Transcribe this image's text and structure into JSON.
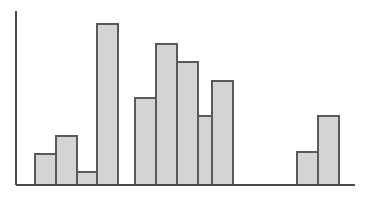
{
  "chart_data": {
    "type": "bar",
    "title": "",
    "subtitle": "",
    "xlabel": "",
    "ylabel": "",
    "categories": [
      "1",
      "2",
      "3",
      "4",
      "5",
      "6",
      "7",
      "8",
      "9",
      "10",
      "11"
    ],
    "values": [
      31,
      49,
      13,
      161,
      87,
      141,
      123,
      69,
      104,
      33,
      69
    ],
    "series": [
      {
        "name": "",
        "values": [
          31,
          49,
          13,
          161,
          87,
          141,
          123,
          69,
          104,
          33,
          69
        ]
      }
    ],
    "groups": [
      {
        "name": "group-left",
        "indices": [
          0,
          1,
          2,
          3
        ]
      },
      {
        "name": "group-middle",
        "indices": [
          4,
          5,
          6,
          7,
          8
        ]
      },
      {
        "name": "group-right",
        "indices": [
          9,
          10
        ]
      }
    ],
    "ylim": [
      0,
      174
    ],
    "xlim": [
      0,
      339
    ],
    "grid": false,
    "legend": null,
    "legend_position": "none",
    "tick_labels_x": [],
    "tick_labels_y": [],
    "annotations": [],
    "bar_width": 20,
    "bar_gap": 0,
    "group_gap": 18,
    "colors": {
      "bar_fill": "#d4d4d4",
      "bar_stroke": "#595959",
      "axis": "#4a4a4a",
      "background": "#ffffff"
    },
    "geometry": {
      "baseline_y": 185,
      "axis_x": 16,
      "axis_top_y": 11,
      "axis_right_x": 355,
      "bars": [
        {
          "x": 35,
          "width": 21,
          "top": 154,
          "height": 31
        },
        {
          "x": 56,
          "width": 21,
          "top": 136,
          "height": 49
        },
        {
          "x": 77,
          "width": 20,
          "top": 172,
          "height": 13
        },
        {
          "x": 97,
          "width": 21,
          "top": 24,
          "height": 161
        },
        {
          "x": 135,
          "width": 21,
          "top": 98,
          "height": 87
        },
        {
          "x": 156,
          "width": 21,
          "top": 44,
          "height": 141
        },
        {
          "x": 177,
          "width": 21,
          "top": 62,
          "height": 123
        },
        {
          "x": 198,
          "width": 20,
          "top": 116,
          "height": 69
        },
        {
          "x": 212,
          "width": 21,
          "top": 81,
          "height": 104
        },
        {
          "x": 297,
          "width": 21,
          "top": 152,
          "height": 33
        },
        {
          "x": 318,
          "width": 21,
          "top": 116,
          "height": 69
        }
      ]
    }
  }
}
